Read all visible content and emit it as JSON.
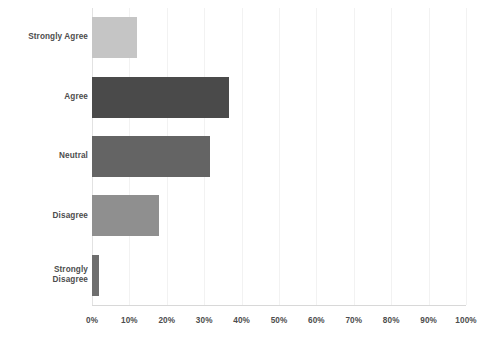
{
  "chart_data": {
    "type": "bar",
    "orientation": "horizontal",
    "title": "",
    "subtitle": "",
    "xlabel": "",
    "ylabel": "",
    "categories": [
      "Strongly Agree",
      "Agree",
      "Neutral",
      "Disagree",
      "Strongly Disagree"
    ],
    "values": [
      12,
      36.5,
      31.5,
      18,
      2
    ],
    "value_suffix": "%",
    "xlim": [
      0,
      100
    ],
    "xticks": [
      0,
      10,
      20,
      30,
      40,
      50,
      60,
      70,
      80,
      90,
      100
    ],
    "xtick_labels": [
      "0%",
      "10%",
      "20%",
      "30%",
      "40%",
      "50%",
      "60%",
      "70%",
      "80%",
      "90%",
      "100%"
    ],
    "grid": true,
    "legend": false,
    "bar_colors": [
      "#c5c5c5",
      "#4a4a4a",
      "#646464",
      "#8f8f8f",
      "#6e6e6e"
    ],
    "series": [
      {
        "name": "Response share",
        "points": [
          {
            "category": "Strongly Agree",
            "value": 12,
            "color": "#c5c5c5"
          },
          {
            "category": "Agree",
            "value": 36.5,
            "color": "#4a4a4a"
          },
          {
            "category": "Neutral",
            "value": 31.5,
            "color": "#646464"
          },
          {
            "category": "Disagree",
            "value": 18,
            "color": "#8f8f8f"
          },
          {
            "category": "Strongly Disagree",
            "value": 2,
            "color": "#6e6e6e"
          }
        ]
      }
    ]
  },
  "axis": {
    "tick_color": "#4d4d4d",
    "grid_color": "#f2f2f2",
    "baseline_color": "#d8d8d8"
  },
  "labels": {
    "cat0": "Strongly Agree",
    "cat1": "Agree",
    "cat2": "Neutral",
    "cat3_line1": "Strongly",
    "cat3_line2": "Disagree",
    "cat4": "Disagree"
  }
}
